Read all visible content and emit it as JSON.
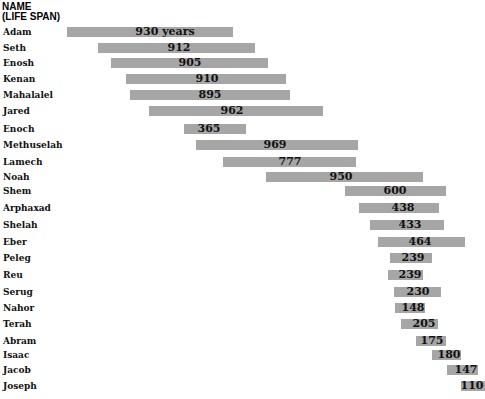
{
  "header": {
    "line1": "NAME",
    "line2": "(LIFE SPAN)"
  },
  "colors": {
    "bar": "#a6a6a6",
    "text": "#111111"
  },
  "chart_data": {
    "type": "bar",
    "orientation": "horizontal-timeline",
    "title": "NAME (LIFE SPAN)",
    "xlabel": "",
    "ylabel": "",
    "grid": false,
    "legend": "none",
    "unit": "years",
    "categories": [
      "Adam",
      "Seth",
      "Enosh",
      "Kenan",
      "Mahalalel",
      "Jared",
      "Enoch",
      "Methuselah",
      "Lamech",
      "Noah",
      "Shem",
      "Arphaxad",
      "Shelah",
      "Eber",
      "Peleg",
      "Reu",
      "Serug",
      "Nahor",
      "Terah",
      "Abram",
      "Isaac",
      "Jacob",
      "Joseph"
    ],
    "values": [
      930,
      912,
      905,
      910,
      895,
      962,
      365,
      969,
      777,
      950,
      600,
      438,
      433,
      464,
      239,
      239,
      230,
      148,
      205,
      175,
      180,
      147,
      110
    ],
    "labels": [
      "930 years",
      "912",
      "905",
      "910",
      "895",
      "962",
      "365",
      "969",
      "777",
      "950",
      "600",
      "438",
      "433",
      "464",
      "239",
      "239",
      "230",
      "148",
      "205",
      "175",
      "180",
      "147",
      "110"
    ]
  },
  "rows": [
    {
      "name": "Adam",
      "label": "930 years",
      "x": 67,
      "w": 166,
      "y": 32,
      "lx": 165
    },
    {
      "name": "Seth",
      "label": "912",
      "x": 98,
      "w": 157,
      "y": 48,
      "lx": 179
    },
    {
      "name": "Enosh",
      "label": "905",
      "x": 111,
      "w": 157,
      "y": 63,
      "lx": 190
    },
    {
      "name": "Kenan",
      "label": "910",
      "x": 126,
      "w": 160,
      "y": 79,
      "lx": 207
    },
    {
      "name": "Mahalalel",
      "label": "895",
      "x": 130,
      "w": 160,
      "y": 95,
      "lx": 210
    },
    {
      "name": "Jared",
      "label": "962",
      "x": 149,
      "w": 174,
      "y": 111,
      "lx": 232
    },
    {
      "name": "Enoch",
      "label": "365",
      "x": 184,
      "w": 62,
      "y": 129,
      "lx": 209
    },
    {
      "name": "Methuselah",
      "label": "969",
      "x": 196,
      "w": 162,
      "y": 145,
      "lx": 275
    },
    {
      "name": "Lamech",
      "label": "777",
      "x": 223,
      "w": 133,
      "y": 162,
      "lx": 290
    },
    {
      "name": "Noah",
      "label": "950",
      "x": 266,
      "w": 157,
      "y": 177,
      "lx": 341
    },
    {
      "name": "Shem",
      "label": "600",
      "x": 345,
      "w": 101,
      "y": 191,
      "lx": 395
    },
    {
      "name": "Arphaxad",
      "label": "438",
      "x": 359,
      "w": 80,
      "y": 208,
      "lx": 403
    },
    {
      "name": "Shelah",
      "label": "433",
      "x": 370,
      "w": 74,
      "y": 225,
      "lx": 410
    },
    {
      "name": "Eber",
      "label": "464",
      "x": 378,
      "w": 87,
      "y": 242,
      "lx": 420
    },
    {
      "name": "Peleg",
      "label": "239",
      "x": 390,
      "w": 42,
      "y": 258,
      "lx": 413
    },
    {
      "name": "Reu",
      "label": "239",
      "x": 388,
      "w": 35,
      "y": 275,
      "lx": 410
    },
    {
      "name": "Serug",
      "label": "230",
      "x": 394,
      "w": 47,
      "y": 292,
      "lx": 418
    },
    {
      "name": "Nahor",
      "label": "148",
      "x": 395,
      "w": 30,
      "y": 308,
      "lx": 413
    },
    {
      "name": "Terah",
      "label": "205",
      "x": 401,
      "w": 37,
      "y": 324,
      "lx": 424
    },
    {
      "name": "Abram",
      "label": "175",
      "x": 416,
      "w": 30,
      "y": 341,
      "lx": 432
    },
    {
      "name": "Isaac",
      "label": "180",
      "x": 432,
      "w": 29,
      "y": 355,
      "lx": 449
    },
    {
      "name": "Jacob",
      "label": "147",
      "x": 447,
      "w": 31,
      "y": 370,
      "lx": 466
    },
    {
      "name": "Joseph",
      "label": "110",
      "x": 461,
      "w": 24,
      "y": 386,
      "lx": 472
    }
  ]
}
